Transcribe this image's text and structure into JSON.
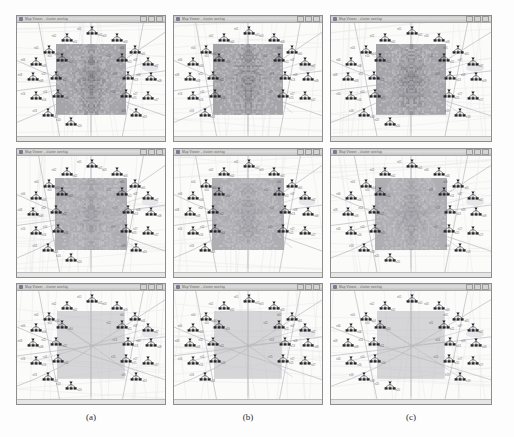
{
  "figure": {
    "layout": "3x3 grid of application screenshots with column captions",
    "rows": 3,
    "columns": 3,
    "background_color": "#fdfdfd"
  },
  "captions": [
    {
      "label": "(a)",
      "column": 1
    },
    {
      "label": "(b)",
      "column": 2
    },
    {
      "label": "(c)",
      "column": 3
    }
  ],
  "colors": {
    "panel_border": "#8d8d8d",
    "titlebar": "#cfcfcf",
    "canvas_background": "#fbfbfa",
    "map_line": "#b9b9bd",
    "heat_dark": "#6f6f74",
    "heat_mid": "#9a9aa0",
    "heat_light": "#c2c2c6",
    "node_fill": "#2f2f34",
    "label_text": "#4a4a4a"
  },
  "panels": [
    {
      "id": "r1c1",
      "row": 1,
      "column": 1,
      "window_title": "Map Viewer - cluster overlay",
      "heat_style": "dense",
      "node_count": 20
    },
    {
      "id": "r1c2",
      "row": 1,
      "column": 2,
      "window_title": "Map Viewer - cluster overlay",
      "heat_style": "dense",
      "node_count": 18
    },
    {
      "id": "r1c3",
      "row": 1,
      "column": 3,
      "window_title": "Map Viewer - cluster overlay",
      "heat_style": "dense",
      "node_count": 20
    },
    {
      "id": "r2c1",
      "row": 2,
      "column": 1,
      "window_title": "Map Viewer - cluster overlay",
      "heat_style": "medium",
      "node_count": 20
    },
    {
      "id": "r2c2",
      "row": 2,
      "column": 2,
      "window_title": "Map Viewer - cluster overlay",
      "heat_style": "medium",
      "node_count": 18
    },
    {
      "id": "r2c3",
      "row": 2,
      "column": 3,
      "window_title": "Map Viewer - cluster overlay",
      "heat_style": "medium",
      "node_count": 20
    },
    {
      "id": "r3c1",
      "row": 3,
      "column": 1,
      "window_title": "Map Viewer - cluster overlay",
      "heat_style": "flat",
      "node_count": 20
    },
    {
      "id": "r3c2",
      "row": 3,
      "column": 2,
      "window_title": "Map Viewer - cluster overlay",
      "heat_style": "flat",
      "node_count": 18
    },
    {
      "id": "r3c3",
      "row": 3,
      "column": 3,
      "window_title": "Map Viewer - cluster overlay",
      "heat_style": "flat",
      "node_count": 20
    }
  ],
  "node_labels": [
    "n01",
    "n02",
    "n03",
    "n04",
    "n05",
    "n06",
    "n07",
    "n08",
    "n09",
    "n10",
    "n11",
    "n12",
    "n13",
    "n14",
    "n15",
    "n16",
    "n17",
    "n18",
    "n19",
    "n20"
  ]
}
